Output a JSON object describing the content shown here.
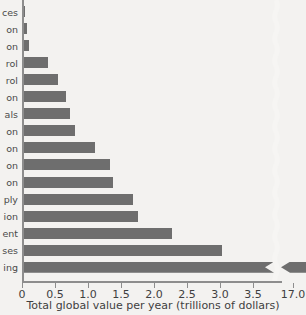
{
  "chart_data": {
    "type": "bar",
    "orientation": "horizontal",
    "title": "",
    "xlabel": "Total global value per year (trillions of dollars)",
    "ylabel": "",
    "xlim": [
      0,
      3.6
    ],
    "xticks": [
      0,
      0.5,
      1.0,
      1.5,
      2.0,
      2.5,
      3.0,
      3.5
    ],
    "xticklabels": [
      "0",
      "0.5",
      "1.0",
      "1.5",
      "2.0",
      "2.5",
      "3.0",
      "3.5"
    ],
    "broken_axis": true,
    "break_tick": 17.0,
    "break_ticklabel": "17.0",
    "grid": false,
    "legend": null,
    "bar_color": "#6e6e6e",
    "background_color": "#f3f2f0",
    "categories": [
      "ces",
      "on",
      "on",
      "rol",
      "rol",
      "on",
      "als",
      "on",
      "on",
      "on",
      "on",
      "ply",
      "ion",
      "ent",
      "ses",
      "ing"
    ],
    "values": [
      0.05,
      0.08,
      0.1,
      0.4,
      0.55,
      0.67,
      0.72,
      0.8,
      1.1,
      1.34,
      1.38,
      1.68,
      1.76,
      2.27,
      3.03,
      17.0
    ],
    "note": "Category labels are clipped at the left edge of the figure; only word endings are visible."
  },
  "axis": {
    "x_title": "Total global value per year (trillions of dollars)"
  }
}
